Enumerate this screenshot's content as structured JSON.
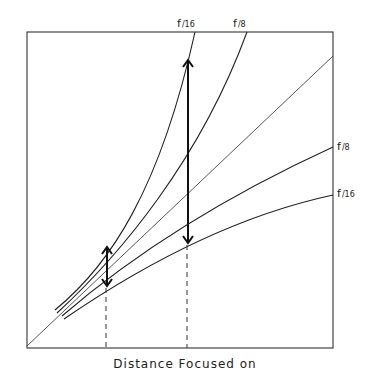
{
  "diagram": {
    "x_axis_label": "Distance Focused on",
    "frame": {
      "x1": 27,
      "y1": 32,
      "x2": 333,
      "y2": 348
    },
    "diagonal": {
      "label": "",
      "from": [
        27,
        346
      ],
      "to": [
        333,
        56
      ]
    },
    "far_limit_curves": [
      {
        "label": "f/16",
        "label_pos": [
          177,
          27
        ],
        "path": "M55,310 C110,265 160,190 195,32"
      },
      {
        "label": "f/8",
        "label_pos": [
          233,
          27
        ],
        "path": "M57,313 C120,255 200,160 247,32"
      }
    ],
    "near_limit_curves": [
      {
        "label": "f/8",
        "label_pos": [
          337,
          150
        ],
        "path": "M62,316 C150,240 250,185 333,147"
      },
      {
        "label": "f/16",
        "label_pos": [
          337,
          197
        ],
        "path": "M64,319 C150,260 240,215 333,195"
      }
    ],
    "arrows": [
      {
        "name": "small-dof-arrow",
        "x": 107,
        "y_top": 247,
        "y_bottom": 286
      },
      {
        "name": "large-dof-arrow",
        "x": 188,
        "y_top": 60,
        "y_bottom": 243
      }
    ],
    "dashed_guides": [
      {
        "x": 106,
        "y_top": 288,
        "y_bottom": 347
      },
      {
        "x": 187,
        "y_top": 245,
        "y_bottom": 348
      }
    ]
  }
}
